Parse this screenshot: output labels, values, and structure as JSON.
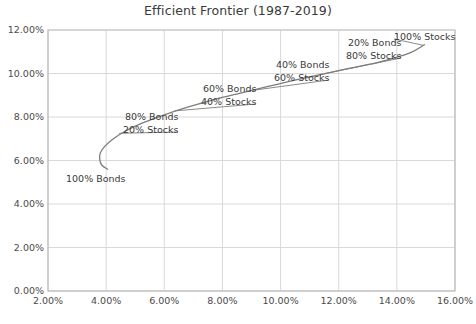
{
  "chart_data": {
    "type": "line",
    "title": "Efficient Frontier (1987-2019)",
    "xlabel": "",
    "ylabel": "",
    "xlim": [
      2.0,
      16.0
    ],
    "ylim": [
      0.0,
      12.0
    ],
    "x_ticks": [
      "2.00%",
      "4.00%",
      "6.00%",
      "8.00%",
      "10.00%",
      "12.00%",
      "14.00%",
      "16.00%"
    ],
    "x_tick_values": [
      2.0,
      4.0,
      6.0,
      8.0,
      10.0,
      12.0,
      14.0,
      16.0
    ],
    "y_ticks": [
      "0.00%",
      "2.00%",
      "4.00%",
      "6.00%",
      "8.00%",
      "10.00%",
      "12.00%"
    ],
    "y_tick_values": [
      0.0,
      2.0,
      4.0,
      6.0,
      8.0,
      10.0,
      12.0
    ],
    "grid": true,
    "legend": "none",
    "series": [
      {
        "name": "Efficient Frontier",
        "color": "#7d7d7d",
        "x": [
          4.05,
          3.85,
          3.78,
          3.8,
          3.95,
          4.25,
          4.7,
          5.3,
          6.0,
          6.8,
          7.65,
          8.55,
          9.5,
          10.45,
          11.45,
          12.45,
          13.45,
          14.45,
          14.95
        ],
        "y": [
          5.6,
          5.78,
          6.05,
          6.35,
          6.65,
          7.0,
          7.38,
          7.75,
          8.1,
          8.45,
          8.78,
          9.08,
          9.38,
          9.68,
          9.97,
          10.26,
          10.55,
          10.95,
          11.32
        ]
      }
    ],
    "annotations": [
      {
        "name": "100-percent-bonds",
        "lines": [
          "100% Bonds"
        ],
        "align": "left",
        "x_px": 66,
        "y_px": 172,
        "point": {
          "x": 3.78,
          "y": 6.05
        },
        "leader": false
      },
      {
        "name": "80-bonds-20-stocks",
        "lines": [
          "80% Bonds",
          "20% Stocks"
        ],
        "align": "right",
        "x_px": 90,
        "y_px": 110,
        "point": {
          "x": 4.45,
          "y": 7.25
        },
        "leader": true
      },
      {
        "name": "60-bonds-40-stocks",
        "lines": [
          "60% Bonds",
          "40% Stocks"
        ],
        "align": "right",
        "x_px": 168,
        "y_px": 82,
        "point": {
          "x": 6.35,
          "y": 8.28
        },
        "leader": true
      },
      {
        "name": "40-bonds-60-stocks",
        "lines": [
          "40% Bonds",
          "60% Stocks"
        ],
        "align": "right",
        "x_px": 241,
        "y_px": 58,
        "point": {
          "x": 8.9,
          "y": 9.2
        },
        "leader": true
      },
      {
        "name": "20-bonds-80-stocks",
        "lines": [
          "20% Bonds",
          "80% Stocks"
        ],
        "align": "right",
        "x_px": 313,
        "y_px": 36,
        "point": {
          "x": 11.35,
          "y": 9.95
        },
        "leader": true
      },
      {
        "name": "100-percent-stocks",
        "lines": [
          "100% Stocks"
        ],
        "align": "left",
        "x_px": 394,
        "y_px": 30,
        "point": {
          "x": 14.9,
          "y": 11.3
        },
        "leader": true
      }
    ],
    "colors": {
      "line": "#7d7d7d",
      "grid": "#d9d9d9",
      "axis": "#bfbfbf",
      "text": "#3a3a3a",
      "background": "#ffffff"
    }
  }
}
